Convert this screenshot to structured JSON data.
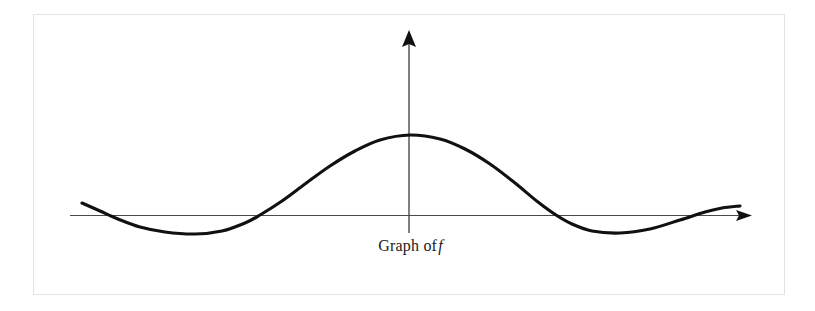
{
  "figure": {
    "caption_prefix": "Graph of",
    "caption_symbol": "f",
    "caption_full": "Graph of f",
    "background_color": "#ffffff",
    "frame_color": "#e3e3e3",
    "curve_color": "#111111",
    "axis_color": "#4a4a4a",
    "axis_label_x": "",
    "axis_label_y": ""
  },
  "chart_data": {
    "type": "line",
    "xlabel": "",
    "ylabel": "",
    "grid": false,
    "legend": "none",
    "axes": {
      "x_axis_y_pixel": 215,
      "y_axis_x_pixel": 409,
      "x_axis_start_pixel": 70,
      "x_axis_end_pixel": 752,
      "y_axis_top_pixel": 30,
      "y_axis_bottom_pixel": 233,
      "x_arrow": "right",
      "y_arrow": "up"
    },
    "annotations": [
      {
        "text": "Graph of f",
        "x_pixel": 414,
        "y_pixel": 247
      }
    ],
    "series": [
      {
        "name": "f",
        "points_pixel": [
          [
            82,
            203
          ],
          [
            100,
            211
          ],
          [
            118,
            219
          ],
          [
            140,
            227
          ],
          [
            165,
            232
          ],
          [
            195,
            234
          ],
          [
            222,
            231
          ],
          [
            245,
            223
          ],
          [
            260,
            215
          ],
          [
            282,
            201
          ],
          [
            305,
            184
          ],
          [
            330,
            166
          ],
          [
            355,
            151
          ],
          [
            380,
            140
          ],
          [
            410,
            135
          ],
          [
            440,
            139
          ],
          [
            465,
            149
          ],
          [
            490,
            164
          ],
          [
            515,
            183
          ],
          [
            538,
            202
          ],
          [
            556,
            215
          ],
          [
            572,
            224
          ],
          [
            592,
            231
          ],
          [
            620,
            233
          ],
          [
            650,
            229
          ],
          [
            680,
            220
          ],
          [
            705,
            212
          ],
          [
            722,
            208
          ],
          [
            740,
            206
          ]
        ],
        "zero_crossings_pixel": [
          105,
          260,
          556,
          718
        ],
        "peak_pixel": [
          410,
          135
        ],
        "troughs_pixel": [
          [
            195,
            234
          ],
          [
            620,
            233
          ]
        ]
      }
    ]
  }
}
